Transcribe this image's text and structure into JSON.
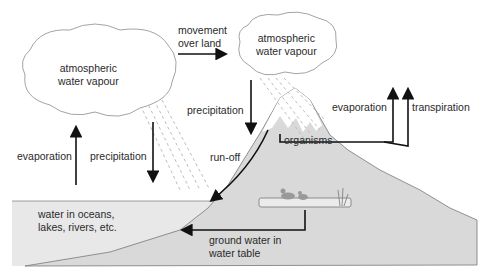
{
  "diagram": {
    "clouds": [
      {
        "id": "ocean-cloud",
        "line1": "atmospheric",
        "line2": "water vapour"
      },
      {
        "id": "land-cloud",
        "line1": "atmospheric",
        "line2": "water vapour"
      }
    ],
    "labels": {
      "movement_line1": "movement",
      "movement_line2": "over land",
      "precipitation_land": "precipitation",
      "precipitation_ocean": "precipitation",
      "evaporation_ocean": "evaporation",
      "evaporation_land": "evaporation",
      "transpiration": "transpiration",
      "organisms": "organisms",
      "runoff": "run-off",
      "water_line1": "water in oceans,",
      "water_line2": "lakes, rivers, etc.",
      "ground_line1": "ground water in",
      "ground_line2": "water table"
    },
    "colors": {
      "water": "#e6e6e6",
      "land": "#d9d9d9",
      "snow": "#ffffff",
      "line": "#222222",
      "rain": "#bbbbbb"
    }
  }
}
